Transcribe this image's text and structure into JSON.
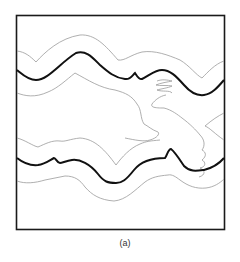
{
  "figure": {
    "caption": "(a)",
    "frame_color": "#1a1a1a",
    "thick_line_color": "#111111",
    "thin_line_color": "#9a9a9a"
  }
}
